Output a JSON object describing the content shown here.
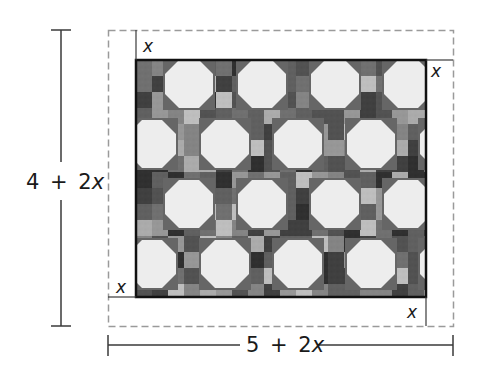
{
  "figure": {
    "type": "quilt-dimension-diagram",
    "colors": {
      "background": "#ffffff",
      "dashed_border": "#9a9a9a",
      "dimension_lines": "#3a3a3a",
      "quilt_border": "#111111",
      "octagon_fill": "#ededed",
      "label_text": "#1a1a1a"
    },
    "labels": {
      "border_top_left": "x",
      "border_top_right": "x",
      "border_bottom_left": "x",
      "border_bottom_right": "x",
      "height_dimension": {
        "const": "4",
        "op": "+",
        "coef": "2",
        "var": "x"
      },
      "width_dimension": {
        "const": "5",
        "op": "+",
        "coef": "2",
        "var": "x"
      }
    },
    "quilt": {
      "pattern": "snowball and nine-patch",
      "inner_width_label": "5",
      "inner_height_label": "4",
      "border_width_label": "x"
    }
  }
}
